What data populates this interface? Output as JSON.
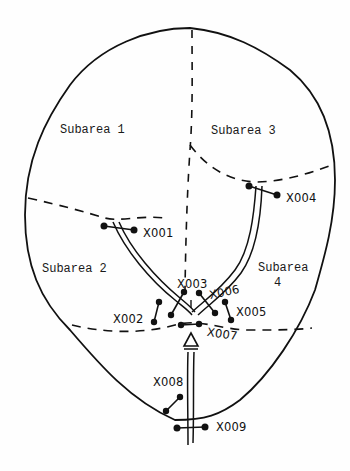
{
  "diagram": {
    "type": "area map with branching path",
    "outline_color": "#111111",
    "subareas": [
      {
        "id": "subarea-1",
        "label": "Subarea 1"
      },
      {
        "id": "subarea-2",
        "label": "Subarea 2"
      },
      {
        "id": "subarea-3",
        "label": "Subarea 3"
      },
      {
        "id": "subarea-4",
        "label": "Subarea 4",
        "line1": "Subarea",
        "line2": "4"
      }
    ],
    "markers": [
      {
        "id": "X001",
        "label": "X001"
      },
      {
        "id": "X002",
        "label": "X002"
      },
      {
        "id": "X003",
        "label": "X003"
      },
      {
        "id": "X004",
        "label": "X004"
      },
      {
        "id": "X005",
        "label": "X005"
      },
      {
        "id": "X006",
        "label": "X006"
      },
      {
        "id": "X007",
        "label": "X007"
      },
      {
        "id": "X008",
        "label": "X008"
      },
      {
        "id": "X009",
        "label": "X009"
      }
    ],
    "entry_arrow": "up-triangle"
  }
}
